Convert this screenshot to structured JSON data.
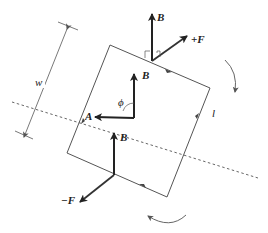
{
  "diagram": {
    "type": "current-loop-torque-in-magnetic-field",
    "labels": {
      "w": "w",
      "l": "l",
      "phi": "ϕ",
      "A": "A",
      "B_top": "B",
      "B_center": "B",
      "B_bottom": "B",
      "F_plus": "+F",
      "F_minus": "−F"
    },
    "colors": {
      "loop": "#555555",
      "vector": "#222222",
      "axis": "#555555",
      "background": "#ffffff"
    },
    "elements": {
      "loop": {
        "corners": [
          [
            110,
            45
          ],
          [
            210,
            88
          ],
          [
            167,
            197
          ],
          [
            67,
            153
          ]
        ]
      },
      "rotation_axis": {
        "style": "dashed",
        "from": [
          12,
          102
        ],
        "to": [
          258,
          178
        ]
      },
      "width_dimension": {
        "label": "w"
      },
      "length_label": {
        "label": "l"
      },
      "rotation_arrows": [
        "clockwise-top-right",
        "counterclockwise-bottom"
      ]
    }
  }
}
